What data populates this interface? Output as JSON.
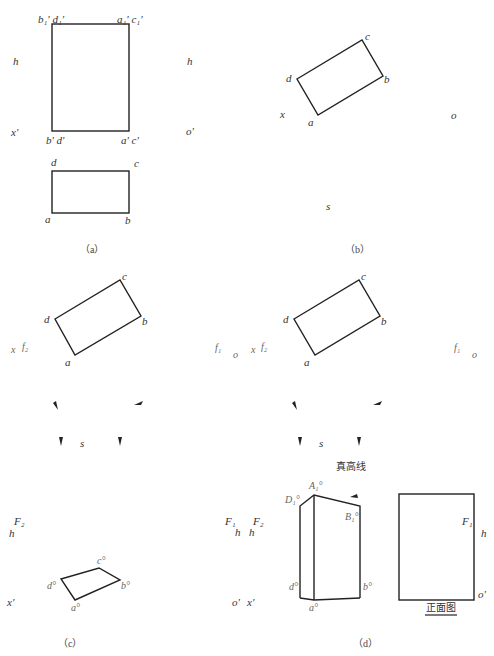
{
  "panels": {
    "a": {
      "caption": "（a）",
      "top_rect_labels": {
        "tl": "b₁' d₁'",
        "tr": "a₁' c₁'",
        "bl": "b' d'",
        "br": "a' c'"
      },
      "axis_labels": {
        "h_left": "h",
        "h_right": "h",
        "x_prime": "x'",
        "o_prime": "o'"
      },
      "bottom_rect_labels": {
        "d": "d",
        "c": "c",
        "a": "a",
        "b": "b"
      }
    },
    "b": {
      "caption": "（b）",
      "rect_labels": {
        "c": "c",
        "d": "d",
        "b": "b",
        "a": "a"
      },
      "axis_labels": {
        "x": "x",
        "o": "o",
        "s": "s"
      }
    },
    "c": {
      "caption": "（c）",
      "rect_labels": {
        "c": "c",
        "d": "d",
        "b": "b",
        "a": "a"
      },
      "axis_labels": {
        "x": "x",
        "f2": "f₂",
        "f1": "f₁",
        "o": "o",
        "s": "s"
      },
      "bottom_labels": {
        "F2": "F₂",
        "h": "h",
        "x_prime": "x'"
      },
      "perspective_labels": {
        "c": "c°",
        "d": "d°",
        "b": "b°",
        "a": "a°"
      }
    },
    "d": {
      "caption": "（d）",
      "rect_labels": {
        "c": "c",
        "d": "d",
        "b": "b",
        "a": "a"
      },
      "axis_labels": {
        "x": "x",
        "f2": "f₂",
        "f1": "f₁",
        "o": "o",
        "s": "s"
      },
      "true_height_line": "真高线",
      "left_labels": {
        "F1": "F₁",
        "F2": "F₂",
        "h1": "h",
        "h2": "h",
        "o_prime": "o'",
        "x_prime": "x'"
      },
      "perspective_labels": {
        "A1": "A₁°",
        "D1": "D₁°",
        "B1": "B₁°",
        "d": "d°",
        "a": "a°",
        "b": "b°"
      },
      "front_view": {
        "label": "正面图",
        "F1": "F₁",
        "h": "h",
        "o_prime": "o'"
      }
    }
  }
}
